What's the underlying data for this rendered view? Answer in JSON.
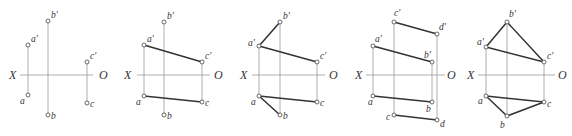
{
  "figure": {
    "colors": {
      "background": "#ffffff",
      "thin_line": "#9a9a9a",
      "thick_line": "#333333",
      "text": "#333333"
    },
    "axis_labels": {
      "left": "X",
      "right": "O"
    },
    "panels": [
      {
        "id": "panel-1",
        "axis": {
          "y": 75,
          "x1": 20,
          "x2": 93,
          "xlabel_x": 9,
          "olabel_x": 99
        },
        "points": [
          {
            "label": "a'",
            "x": 28,
            "y": 45,
            "lx": 31,
            "ly": 42
          },
          {
            "label": "b'",
            "x": 48,
            "y": 21,
            "lx": 51,
            "ly": 18
          },
          {
            "label": "c'",
            "x": 87,
            "y": 62,
            "lx": 90,
            "ly": 59
          },
          {
            "label": "a",
            "x": 28,
            "y": 95,
            "lx": 20,
            "ly": 104
          },
          {
            "label": "b",
            "x": 48,
            "y": 115,
            "lx": 51,
            "ly": 119
          },
          {
            "label": "c",
            "x": 87,
            "y": 103,
            "lx": 90,
            "ly": 107
          }
        ],
        "projectors": [
          [
            28,
            45,
            28,
            95
          ],
          [
            48,
            21,
            48,
            115
          ],
          [
            87,
            62,
            87,
            103
          ]
        ],
        "edges": []
      },
      {
        "id": "panel-2",
        "axis": {
          "y": 75,
          "x1": 137,
          "x2": 210,
          "xlabel_x": 124,
          "olabel_x": 214
        },
        "points": [
          {
            "label": "a'",
            "x": 144,
            "y": 45,
            "lx": 147,
            "ly": 42
          },
          {
            "label": "b'",
            "x": 164,
            "y": 22,
            "lx": 167,
            "ly": 19
          },
          {
            "label": "c'",
            "x": 202,
            "y": 62,
            "lx": 205,
            "ly": 59
          },
          {
            "label": "a",
            "x": 144,
            "y": 96,
            "lx": 136,
            "ly": 105
          },
          {
            "label": "b",
            "x": 164,
            "y": 115,
            "lx": 167,
            "ly": 119
          },
          {
            "label": "c",
            "x": 202,
            "y": 102,
            "lx": 205,
            "ly": 106
          }
        ],
        "projectors": [
          [
            144,
            45,
            144,
            96
          ],
          [
            164,
            22,
            164,
            115
          ],
          [
            202,
            62,
            202,
            102
          ]
        ],
        "edges": [
          [
            144,
            45,
            202,
            62
          ],
          [
            144,
            96,
            202,
            102
          ]
        ]
      },
      {
        "id": "panel-3",
        "axis": {
          "y": 75,
          "x1": 252,
          "x2": 325,
          "xlabel_x": 240,
          "olabel_x": 329
        },
        "points": [
          {
            "label": "a'",
            "x": 259,
            "y": 46,
            "lx": 248,
            "ly": 46
          },
          {
            "label": "b'",
            "x": 280,
            "y": 22,
            "lx": 283,
            "ly": 19
          },
          {
            "label": "c'",
            "x": 317,
            "y": 62,
            "lx": 320,
            "ly": 59
          },
          {
            "label": "a",
            "x": 259,
            "y": 96,
            "lx": 251,
            "ly": 105
          },
          {
            "label": "b",
            "x": 280,
            "y": 115,
            "lx": 283,
            "ly": 119
          },
          {
            "label": "c",
            "x": 317,
            "y": 102,
            "lx": 320,
            "ly": 106
          }
        ],
        "projectors": [
          [
            259,
            46,
            259,
            96
          ],
          [
            280,
            22,
            280,
            115
          ],
          [
            317,
            62,
            317,
            102
          ]
        ],
        "edges": [
          [
            259,
            46,
            280,
            22
          ],
          [
            259,
            46,
            317,
            62
          ],
          [
            259,
            96,
            280,
            115
          ],
          [
            259,
            96,
            317,
            102
          ]
        ]
      },
      {
        "id": "panel-4",
        "axis": {
          "y": 75,
          "x1": 366,
          "x2": 445,
          "xlabel_x": 355,
          "olabel_x": 447
        },
        "points": [
          {
            "label": "a'",
            "x": 373,
            "y": 46,
            "lx": 375,
            "ly": 42
          },
          {
            "label": "b'",
            "x": 432,
            "y": 62,
            "lx": 424,
            "ly": 58
          },
          {
            "label": "c'",
            "x": 394,
            "y": 22,
            "lx": 394,
            "ly": 16
          },
          {
            "label": "d'",
            "x": 437,
            "y": 34,
            "lx": 439,
            "ly": 30
          },
          {
            "label": "a",
            "x": 373,
            "y": 96,
            "lx": 368,
            "ly": 105
          },
          {
            "label": "b",
            "x": 432,
            "y": 102,
            "lx": 426,
            "ly": 112
          },
          {
            "label": "c",
            "x": 394,
            "y": 115,
            "lx": 386,
            "ly": 120
          },
          {
            "label": "d",
            "x": 437,
            "y": 120,
            "lx": 440,
            "ly": 127
          }
        ],
        "projectors": [
          [
            373,
            46,
            373,
            96
          ],
          [
            432,
            62,
            432,
            102
          ],
          [
            394,
            22,
            394,
            115
          ],
          [
            437,
            34,
            437,
            120
          ]
        ],
        "edges": [
          [
            373,
            46,
            432,
            62
          ],
          [
            394,
            22,
            437,
            34
          ],
          [
            373,
            96,
            432,
            102
          ],
          [
            394,
            115,
            437,
            120
          ]
        ]
      },
      {
        "id": "panel-5",
        "axis": {
          "y": 75,
          "x1": 478,
          "x2": 555,
          "xlabel_x": 467,
          "olabel_x": 558
        },
        "points": [
          {
            "label": "a'",
            "x": 486,
            "y": 47,
            "lx": 477,
            "ly": 45
          },
          {
            "label": "b'",
            "x": 507,
            "y": 22,
            "lx": 509,
            "ly": 17
          },
          {
            "label": "c'",
            "x": 544,
            "y": 62,
            "lx": 547,
            "ly": 59
          },
          {
            "label": "a",
            "x": 486,
            "y": 96,
            "lx": 478,
            "ly": 104
          },
          {
            "label": "b",
            "x": 507,
            "y": 116,
            "lx": 500,
            "ly": 128
          },
          {
            "label": "c",
            "x": 544,
            "y": 102,
            "lx": 547,
            "ly": 107
          }
        ],
        "projectors": [
          [
            486,
            47,
            486,
            96
          ],
          [
            507,
            22,
            507,
            116
          ],
          [
            544,
            62,
            544,
            102
          ]
        ],
        "edges": [
          [
            486,
            47,
            507,
            22
          ],
          [
            507,
            22,
            544,
            62
          ],
          [
            486,
            47,
            544,
            62
          ],
          [
            486,
            96,
            507,
            116
          ],
          [
            507,
            116,
            544,
            102
          ],
          [
            486,
            96,
            544,
            102
          ]
        ]
      }
    ]
  }
}
